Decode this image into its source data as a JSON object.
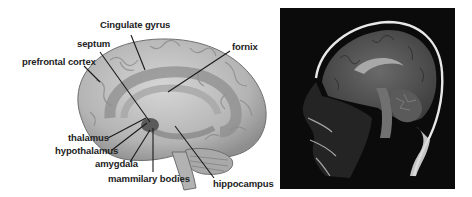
{
  "figure": {
    "left_panel": {
      "type": "labeled brain illustration (medial view, limbic system)",
      "labels": [
        {
          "id": "cingulate-gyrus",
          "text": "Cingulate gyrus"
        },
        {
          "id": "septum",
          "text": "septum"
        },
        {
          "id": "prefrontal-cortex",
          "text": "prefrontal cortex"
        },
        {
          "id": "fornix",
          "text": "fornix"
        },
        {
          "id": "thalamus",
          "text": "thalamus"
        },
        {
          "id": "hypothalamus",
          "text": "hypothalamus"
        },
        {
          "id": "amygdala",
          "text": "amygdala"
        },
        {
          "id": "mammilary-bodies",
          "text": "mammilary bodies"
        },
        {
          "id": "hippocampus",
          "text": "hippocampus"
        }
      ]
    },
    "right_panel": {
      "type": "sagittal MRI of human head"
    }
  },
  "colors": {
    "brain_fill": "#bdbdbd",
    "brain_dark": "#8a8a8a",
    "limbic_band": "#9a9a9a",
    "label_text": "#222222",
    "mri_bg": "#0b0b0b"
  }
}
